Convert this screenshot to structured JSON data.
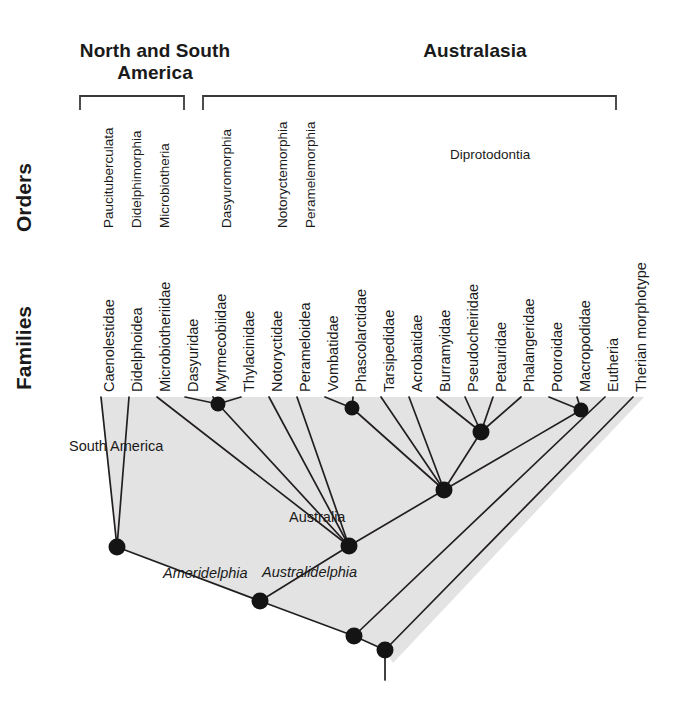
{
  "figure": {
    "type": "phylogenetic-tree",
    "background": "#ffffff",
    "shade_color": "#e3e3e3",
    "line_color": "#231f20",
    "node_color": "#141414"
  },
  "regions": [
    {
      "label": "North and South\nAmerica",
      "bracket": {
        "x1": 80,
        "x2": 184,
        "y": 96,
        "tick": 14
      }
    },
    {
      "label": "Australasia",
      "bracket": {
        "x1": 203,
        "x2": 616,
        "y": 96,
        "tick": 14
      }
    }
  ],
  "axis_labels": {
    "orders": "Orders",
    "families": "Families"
  },
  "orders": [
    {
      "label": "Paucituberculata",
      "x": 101,
      "y": 228,
      "rotated": true
    },
    {
      "label": "Didelphimorphia",
      "x": 129,
      "y": 228,
      "rotated": true
    },
    {
      "label": "Microbiotheria",
      "x": 157,
      "y": 228,
      "rotated": true
    },
    {
      "label": "Dasyuromorphia",
      "x": 219,
      "y": 228,
      "rotated": true
    },
    {
      "label": "Notoryctemorphia",
      "x": 275,
      "y": 228,
      "rotated": true
    },
    {
      "label": "Peramelemorphia",
      "x": 303,
      "y": 228,
      "rotated": true
    },
    {
      "label": "Diprotodontia",
      "x": 450,
      "y": 147,
      "rotated": false
    }
  ],
  "families": [
    {
      "label": "Caenolestidae",
      "x": 101,
      "y": 392
    },
    {
      "label": "Didelphoidea",
      "x": 129,
      "y": 392
    },
    {
      "label": "Microbiotheriidae",
      "x": 157,
      "y": 392
    },
    {
      "label": "Dasyuridae",
      "x": 185,
      "y": 392
    },
    {
      "label": "Myrmecobiidae",
      "x": 213,
      "y": 392
    },
    {
      "label": "Thylacinidae",
      "x": 241,
      "y": 392
    },
    {
      "label": "Notoryctidae",
      "x": 269,
      "y": 392
    },
    {
      "label": "Perameloidea",
      "x": 297,
      "y": 392
    },
    {
      "label": "Vombatidae",
      "x": 325,
      "y": 392
    },
    {
      "label": "Phascolarctidae",
      "x": 353,
      "y": 392
    },
    {
      "label": "Tarsipedidae",
      "x": 381,
      "y": 392
    },
    {
      "label": "Acrobatidae",
      "x": 409,
      "y": 392
    },
    {
      "label": "Burramyidae",
      "x": 437,
      "y": 392
    },
    {
      "label": "Pseudocheiridae",
      "x": 465,
      "y": 392
    },
    {
      "label": "Petauridae",
      "x": 493,
      "y": 392
    },
    {
      "label": "Phalangeridae",
      "x": 521,
      "y": 392
    },
    {
      "label": "Potoroidae",
      "x": 549,
      "y": 392
    },
    {
      "label": "Macropodidae",
      "x": 577,
      "y": 392
    },
    {
      "label": "Eutheria",
      "x": 605,
      "y": 392
    },
    {
      "label": "Therian morphotype",
      "x": 633,
      "y": 392
    }
  ],
  "annotations": [
    {
      "label": "South America",
      "x": 69,
      "y": 438,
      "italic": false
    },
    {
      "label": "Australia",
      "x": 289,
      "y": 509,
      "italic": false
    },
    {
      "label": "Ameridelphia",
      "x": 163,
      "y": 565,
      "italic": true
    },
    {
      "label": "Australidelphia",
      "x": 262,
      "y": 564,
      "italic": true
    }
  ],
  "shade_polygon": "100,397 644,397 393,663 385,650 354,636 260,601 117,547",
  "nodes": [
    {
      "name": "dasyuromorphia-node",
      "x": 218,
      "y": 404,
      "r": 7.5
    },
    {
      "name": "vombatiform-node",
      "x": 352,
      "y": 408,
      "r": 7.5
    },
    {
      "name": "petauroid-node",
      "x": 481,
      "y": 432,
      "r": 8.5
    },
    {
      "name": "macropodoid-node",
      "x": 581,
      "y": 410,
      "r": 7.5
    },
    {
      "name": "diprotodontia-node",
      "x": 444,
      "y": 490,
      "r": 8.5
    },
    {
      "name": "australidelphia-node",
      "x": 349,
      "y": 546,
      "r": 8.5
    },
    {
      "name": "ameridelphia-node",
      "x": 117,
      "y": 547,
      "r": 8.5
    },
    {
      "name": "marsupialia-node",
      "x": 260,
      "y": 601,
      "r": 8.5
    },
    {
      "name": "metatheria-node",
      "x": 354,
      "y": 636,
      "r": 8.5
    },
    {
      "name": "theria-root-node",
      "x": 385,
      "y": 650,
      "r": 8.5
    }
  ],
  "branches": [
    {
      "from": [
        101,
        397
      ],
      "to": [
        117,
        547
      ]
    },
    {
      "from": [
        129,
        397
      ],
      "to": [
        117,
        547
      ]
    },
    {
      "from": [
        157,
        397
      ],
      "to": [
        349,
        546
      ]
    },
    {
      "from": [
        185,
        397
      ],
      "to": [
        218,
        404
      ]
    },
    {
      "from": [
        213,
        397
      ],
      "to": [
        218,
        404
      ]
    },
    {
      "from": [
        241,
        397
      ],
      "to": [
        218,
        404
      ]
    },
    {
      "from": [
        218,
        404
      ],
      "to": [
        349,
        546
      ]
    },
    {
      "from": [
        269,
        397
      ],
      "to": [
        349,
        546
      ]
    },
    {
      "from": [
        297,
        397
      ],
      "to": [
        349,
        546
      ]
    },
    {
      "from": [
        325,
        397
      ],
      "to": [
        352,
        408
      ]
    },
    {
      "from": [
        353,
        397
      ],
      "to": [
        352,
        408
      ]
    },
    {
      "from": [
        352,
        408
      ],
      "to": [
        444,
        490
      ]
    },
    {
      "from": [
        381,
        397
      ],
      "to": [
        444,
        490
      ]
    },
    {
      "from": [
        409,
        397
      ],
      "to": [
        444,
        490
      ]
    },
    {
      "from": [
        437,
        397
      ],
      "to": [
        481,
        432
      ]
    },
    {
      "from": [
        465,
        397
      ],
      "to": [
        481,
        432
      ]
    },
    {
      "from": [
        493,
        397
      ],
      "to": [
        481,
        432
      ]
    },
    {
      "from": [
        521,
        397
      ],
      "to": [
        481,
        432
      ]
    },
    {
      "from": [
        481,
        432
      ],
      "to": [
        444,
        490
      ]
    },
    {
      "from": [
        549,
        397
      ],
      "to": [
        581,
        410
      ]
    },
    {
      "from": [
        577,
        397
      ],
      "to": [
        581,
        410
      ]
    },
    {
      "from": [
        581,
        410
      ],
      "to": [
        444,
        490
      ]
    },
    {
      "from": [
        444,
        490
      ],
      "to": [
        349,
        546
      ]
    },
    {
      "from": [
        349,
        546
      ],
      "to": [
        260,
        601
      ]
    },
    {
      "from": [
        117,
        547
      ],
      "to": [
        260,
        601
      ]
    },
    {
      "from": [
        260,
        601
      ],
      "to": [
        354,
        636
      ]
    },
    {
      "from": [
        605,
        397
      ],
      "to": [
        354,
        636
      ]
    },
    {
      "from": [
        633,
        397
      ],
      "to": [
        385,
        650
      ]
    },
    {
      "from": [
        354,
        636
      ],
      "to": [
        385,
        650
      ]
    },
    {
      "from": [
        385,
        650
      ],
      "to": [
        385,
        680
      ]
    }
  ]
}
